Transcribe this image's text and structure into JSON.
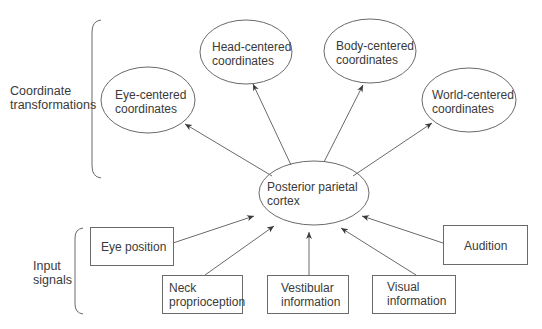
{
  "groups": {
    "coordinate_transformations": {
      "line1": "Coordinate",
      "line2": "transformations"
    },
    "input_signals": {
      "line1": "Input",
      "line2": "signals"
    }
  },
  "central_node": {
    "line1": "Posterior parietal",
    "line2": "cortex"
  },
  "output_nodes": [
    {
      "line1": "Eye-centered",
      "line2": "coordinates"
    },
    {
      "line1": "Head-centered",
      "line2": "coordinates"
    },
    {
      "line1": "Body-centered",
      "line2": "coordinates"
    },
    {
      "line1": "World-centered",
      "line2": "coordinates"
    }
  ],
  "input_nodes": [
    {
      "line1": "Eye position",
      "line2": ""
    },
    {
      "line1": "Neck",
      "line2": "proprioception"
    },
    {
      "line1": "Vestibular",
      "line2": "information"
    },
    {
      "line1": "Visual",
      "line2": "information"
    },
    {
      "line1": "Audition",
      "line2": ""
    }
  ],
  "colors": {
    "stroke": "#6a6a6a",
    "text": "#3a3a3a",
    "background": "#ffffff"
  }
}
